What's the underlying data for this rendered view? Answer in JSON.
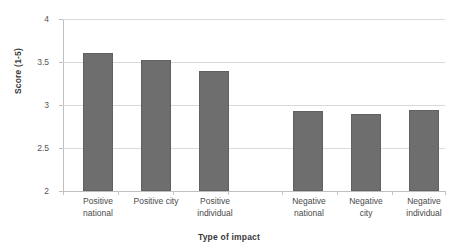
{
  "chart_data": {
    "type": "bar",
    "title": "",
    "xlabel": "Type of impact",
    "ylabel": "Score (1-5)",
    "ylim": [
      2,
      4
    ],
    "yticks": [
      "2",
      "2.5",
      "3",
      "3.5",
      "4"
    ],
    "grid": true,
    "legend": "none",
    "categories": [
      "Positive national",
      "Positive city",
      "Positive individual",
      "Negative national",
      "Negative city",
      "Negative individual"
    ],
    "category_lines": [
      {
        "line1": "Positive",
        "line2": "national"
      },
      {
        "line1": "Positive city",
        "line2": ""
      },
      {
        "line1": "Positive",
        "line2": "individual"
      },
      {
        "line1": "Negative",
        "line2": "national"
      },
      {
        "line1": "Negative",
        "line2": "city"
      },
      {
        "line1": "Negative",
        "line2": "individual"
      }
    ],
    "values": [
      3.6,
      3.52,
      3.4,
      2.93,
      2.9,
      2.94
    ],
    "bar_color": "#6e6e6e",
    "gridline_color": "#d9d9d9",
    "axis_color": "#bfbfbf"
  }
}
